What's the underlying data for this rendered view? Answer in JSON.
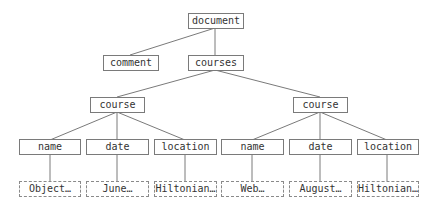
{
  "diagram": {
    "type": "tree",
    "nodes": {
      "document": "document",
      "comment": "comment",
      "courses": "courses",
      "course_1": "course",
      "course_2": "course",
      "name_1": "name",
      "date_1": "date",
      "location_1": "location",
      "name_2": "name",
      "date_2": "date",
      "location_2": "location",
      "name_1_value": "Object…",
      "date_1_value": "June…",
      "location_1_value": "Hiltonian…",
      "name_2_value": "Web…",
      "date_2_value": "August…",
      "location_2_value": "Hiltonian…"
    },
    "edges": [
      [
        "document",
        "comment"
      ],
      [
        "document",
        "courses"
      ],
      [
        "courses",
        "course_1"
      ],
      [
        "courses",
        "course_2"
      ],
      [
        "course_1",
        "name_1"
      ],
      [
        "course_1",
        "date_1"
      ],
      [
        "course_1",
        "location_1"
      ],
      [
        "course_2",
        "name_2"
      ],
      [
        "course_2",
        "date_2"
      ],
      [
        "course_2",
        "location_2"
      ],
      [
        "name_1",
        "name_1_value"
      ],
      [
        "date_1",
        "date_1_value"
      ],
      [
        "location_1",
        "location_1_value"
      ],
      [
        "name_2",
        "name_2_value"
      ],
      [
        "date_2",
        "date_2_value"
      ],
      [
        "location_2",
        "location_2_value"
      ]
    ],
    "colors": {
      "line": "#7a7a7a",
      "text": "#333333",
      "background": "#ffffff"
    }
  }
}
